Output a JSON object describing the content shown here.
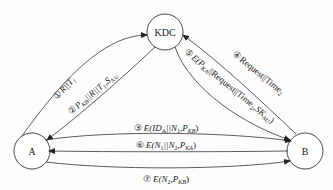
{
  "diagram": {
    "nodes": [
      {
        "id": "kdc",
        "label": "KDC"
      },
      {
        "id": "a",
        "label": "A"
      },
      {
        "id": "b",
        "label": "B"
      }
    ],
    "edges": [
      {
        "step": "①",
        "from": "A",
        "to": "KDC",
        "text": "R||T",
        "sub": "1"
      },
      {
        "step": "②",
        "from": "KDC",
        "to": "A",
        "text": "P",
        "sub": "KB",
        "text2": "||R||T",
        "sub2": "1",
        "text3": ",S",
        "sub3": "AU"
      },
      {
        "step": "③",
        "from": "A",
        "to": "B",
        "text": "E(ID",
        "sub": "A",
        "text2": "||N",
        "sub2": "1",
        "text3": ",P",
        "sub3": "KB",
        "text4": ")"
      },
      {
        "step": "④",
        "from": "B",
        "to": "KDC",
        "text": "Request||Time",
        "sub": "2"
      },
      {
        "step": "⑤",
        "from": "KDC",
        "to": "B",
        "text": "E(P",
        "sub": "KA",
        "text2": "||Request||Time",
        "sub2": "2",
        "text3": ",SK",
        "sub3": "AU",
        "text4": ")"
      },
      {
        "step": "⑥",
        "from": "B",
        "to": "A",
        "text": "E(N",
        "sub": "1",
        "text2": "||N",
        "sub2": "2",
        "text3": ",P",
        "sub3": "KA",
        "text4": ")"
      },
      {
        "step": "⑦",
        "from": "A",
        "to": "B",
        "text": "E(N",
        "sub": "2",
        "text2": ",P",
        "sub2": "KB",
        "text3": ")"
      }
    ]
  }
}
